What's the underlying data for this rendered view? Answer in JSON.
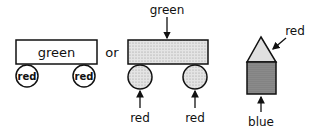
{
  "diagram": {
    "left_figure": {
      "body_label": "green",
      "wheel_labels": [
        "red",
        "red"
      ]
    },
    "connector": "or",
    "middle_figure": {
      "body_label": "green",
      "wheel_labels": [
        "red",
        "red"
      ]
    },
    "right_figure": {
      "roof_label": "red",
      "base_label": "blue"
    }
  },
  "colors": {
    "stroke": "#111111",
    "light_stipple": "#d9d9d9",
    "dark_stipple": "#8a8a8a"
  }
}
